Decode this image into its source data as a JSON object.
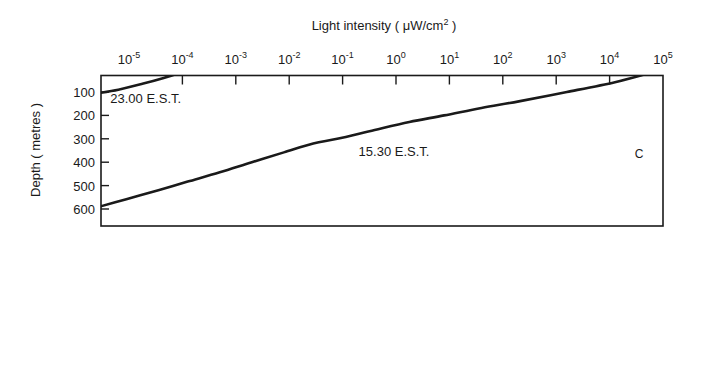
{
  "chart_data": {
    "type": "line",
    "title": "",
    "xlabel": "Light intensity ( μW/cm² )",
    "ylabel": "Depth ( metres )",
    "panel_label": "C",
    "xscale": "log",
    "xlim": [
      1e-05,
      100000.0
    ],
    "ylim": [
      0,
      650
    ],
    "y_inverted": true,
    "grid": false,
    "legend": "inline-labels",
    "xticks": [
      {
        "value": 1e-05,
        "mantissa": "10",
        "exponent": "-5"
      },
      {
        "value": 0.0001,
        "mantissa": "10",
        "exponent": "-4"
      },
      {
        "value": 0.001,
        "mantissa": "10",
        "exponent": "-3"
      },
      {
        "value": 0.01,
        "mantissa": "10",
        "exponent": "-2"
      },
      {
        "value": 0.1,
        "mantissa": "10",
        "exponent": "-1"
      },
      {
        "value": 1,
        "mantissa": "10",
        "exponent": "0"
      },
      {
        "value": 10,
        "mantissa": "10",
        "exponent": "1"
      },
      {
        "value": 100,
        "mantissa": "10",
        "exponent": "2"
      },
      {
        "value": 1000,
        "mantissa": "10",
        "exponent": "3"
      },
      {
        "value": 10000,
        "mantissa": "10",
        "exponent": "4"
      },
      {
        "value": 100000,
        "mantissa": "10",
        "exponent": "5"
      }
    ],
    "yticks": [
      100,
      200,
      300,
      400,
      500,
      600
    ],
    "ytick_labels": [
      "100",
      "200",
      "300",
      "400",
      "500",
      "600"
    ],
    "series": [
      {
        "name": "23.00 E.S.T.",
        "label": "23.00 E.S.T.",
        "color": "#1a1a1a",
        "points": [
          {
            "log_intensity": -5.63,
            "depth": 107
          },
          {
            "log_intensity": -5.2,
            "depth": 90
          },
          {
            "log_intensity": -4.75,
            "depth": 65
          },
          {
            "log_intensity": -4.35,
            "depth": 40
          },
          {
            "log_intensity": -4.05,
            "depth": 18
          },
          {
            "log_intensity": -3.88,
            "depth": 0
          }
        ]
      },
      {
        "name": "15.30 E.S.T.",
        "label": "15.30 E.S.T.",
        "color": "#1a1a1a",
        "points": [
          {
            "log_intensity": -5.63,
            "depth": 595
          },
          {
            "log_intensity": -5.05,
            "depth": 558
          },
          {
            "log_intensity": -4.45,
            "depth": 520
          },
          {
            "log_intensity": -3.9,
            "depth": 483
          },
          {
            "log_intensity": -3.3,
            "depth": 443
          },
          {
            "log_intensity": -2.7,
            "depth": 400
          },
          {
            "log_intensity": -2.1,
            "depth": 358
          },
          {
            "log_intensity": -1.55,
            "depth": 320
          },
          {
            "log_intensity": -1.1,
            "depth": 300
          },
          {
            "log_intensity": -0.4,
            "depth": 262
          },
          {
            "log_intensity": 0.25,
            "depth": 228
          },
          {
            "log_intensity": 0.9,
            "depth": 200
          },
          {
            "log_intensity": 1.6,
            "depth": 168
          },
          {
            "log_intensity": 2.3,
            "depth": 140
          },
          {
            "log_intensity": 3.2,
            "depth": 100
          },
          {
            "log_intensity": 4.1,
            "depth": 58
          },
          {
            "log_intensity": 4.7,
            "depth": 22
          },
          {
            "log_intensity": 5.0,
            "depth": 0
          }
        ]
      }
    ],
    "annotations": [
      {
        "text": "23.00 E.S.T.",
        "log_intensity": -5.35,
        "depth": 145
      },
      {
        "text": "15.30 E.S.T.",
        "log_intensity": -0.7,
        "depth": 372
      },
      {
        "text": "C",
        "log_intensity": 4.55,
        "depth": 380
      }
    ]
  }
}
